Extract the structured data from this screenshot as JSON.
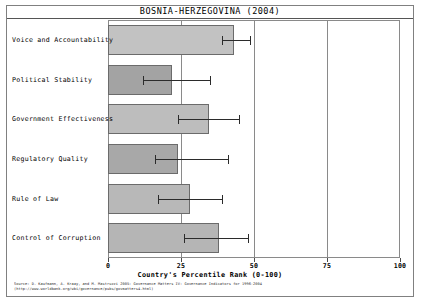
{
  "figure": {
    "title": "BOSNIA-HERZEGOVINA (2004)",
    "source_line_1": "Source: D. Kaufmann, A. Kraay, and M. Mastruzzi 2005: Governance Matters IV: Governance Indicators for 1996-2004",
    "source_line_2": "(http://www.worldbank.org/wbi/governance/pubs/govmatters4.html)"
  },
  "chart_data": {
    "type": "bar",
    "orientation": "horizontal",
    "title": "BOSNIA-HERZEGOVINA (2004)",
    "xlabel": "Country's Percentile Rank (0-100)",
    "ylabel": "",
    "xlim": [
      0,
      100
    ],
    "xticks": [
      0,
      25,
      50,
      75,
      100
    ],
    "xtick_labels": [
      "0",
      "25",
      "50",
      "75",
      "100"
    ],
    "gridlines": [
      25,
      50,
      75
    ],
    "grid": true,
    "legend": "none",
    "categories": [
      "Voice and Accountability",
      "Political Stability",
      "Government Effectiveness",
      "Regulatory Quality",
      "Rule of Law",
      "Control of Corruption"
    ],
    "values": [
      43,
      22,
      34.5,
      24,
      28,
      38
    ],
    "error_low": [
      39,
      12,
      24,
      16,
      17,
      26
    ],
    "error_high": [
      48.5,
      35,
      45,
      41,
      39,
      48
    ],
    "bar_colors": [
      "#c2c2c2",
      "#a3a3a3",
      "#bdbdbd",
      "#a8a8a8",
      "#b8b8b8",
      "#b5b5b5"
    ],
    "bars": [
      {
        "label": "Voice and Accountability",
        "value": 43,
        "low": 39,
        "high": 48.5,
        "color": "#c2c2c2"
      },
      {
        "label": "Political Stability",
        "value": 22,
        "low": 12,
        "high": 35,
        "color": "#a3a3a3"
      },
      {
        "label": "Government Effectiveness",
        "value": 34.5,
        "low": 24,
        "high": 45,
        "color": "#bdbdbd"
      },
      {
        "label": "Regulatory Quality",
        "value": 24,
        "low": 16,
        "high": 41,
        "color": "#a8a8a8"
      },
      {
        "label": "Rule of Law",
        "value": 28,
        "low": 17,
        "high": 39,
        "color": "#b8b8b8"
      },
      {
        "label": "Control of Corruption",
        "value": 38,
        "low": 26,
        "high": 48,
        "color": "#b5b5b5"
      }
    ]
  }
}
